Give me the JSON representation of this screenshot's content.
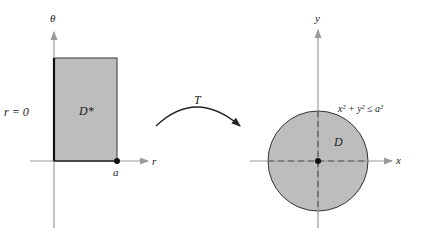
{
  "left_plot": {
    "vertical_axis_label": "θ",
    "horizontal_axis_label": "r",
    "region_label": "D*",
    "edge_label": "r = 0",
    "point_label": "a"
  },
  "transform": {
    "label": "T"
  },
  "right_plot": {
    "vertical_axis_label": "y",
    "horizontal_axis_label": "x",
    "region_label": "D",
    "inequality": "x² + y² ≤ a²"
  },
  "colors": {
    "region_fill": "#bdbdbd",
    "axis": "#9a9a9a",
    "outline": "#333333"
  }
}
